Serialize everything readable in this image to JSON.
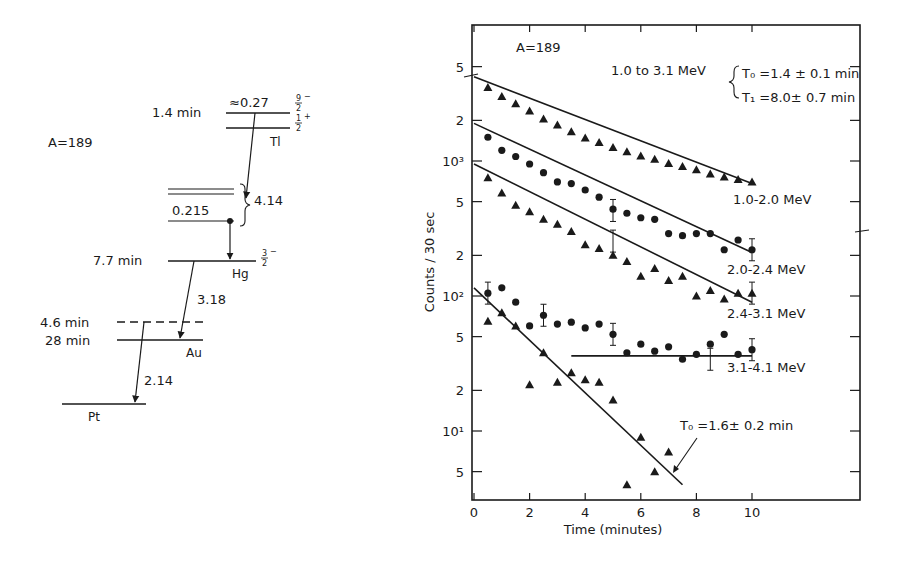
{
  "decay_scheme": {
    "mass_label": "A=189",
    "levels": [
      {
        "nuclide": "Tl",
        "halflife": "1.4 min",
        "energy": "≈0.27",
        "spin_upper": "9/2",
        "parity_upper": "-",
        "spin_lower": "1/2",
        "parity_lower": "+"
      },
      {
        "nuclide": "Hg",
        "halflife": "7.7 min",
        "energy_sub": "0.215",
        "spin": "3/2",
        "parity": "-"
      },
      {
        "nuclide": "Au",
        "halflife_upper": "4.6 min",
        "halflife_lower": "28 min"
      },
      {
        "nuclide": "Pt"
      }
    ],
    "transitions": [
      {
        "from": "Tl",
        "to": "Hg",
        "q_value": "4.14"
      },
      {
        "from": "Hg",
        "to": "Au",
        "q_value": "3.18"
      },
      {
        "from": "Au",
        "to": "Pt",
        "q_value": "2.14"
      }
    ]
  },
  "chart_data": {
    "type": "scatter",
    "title": "A=189",
    "xlabel": "Time (minutes)",
    "ylabel": "Counts / 30 sec",
    "yscale": "log",
    "xlim": [
      0,
      14
    ],
    "ylim": [
      3,
      7000
    ],
    "x_ticks": [
      0,
      2,
      4,
      6,
      8,
      10
    ],
    "y_ticks": [
      {
        "value": 5000,
        "label": "5"
      },
      {
        "value": 2000,
        "label": "2"
      },
      {
        "value": 1000,
        "label": "10³"
      },
      {
        "value": 500,
        "label": "5"
      },
      {
        "value": 200,
        "label": "2"
      },
      {
        "value": 100,
        "label": "10²"
      },
      {
        "value": 50,
        "label": "5"
      },
      {
        "value": 20,
        "label": "2"
      },
      {
        "value": 10,
        "label": "10¹"
      },
      {
        "value": 5,
        "label": "5"
      }
    ],
    "annotations": {
      "fit_range": "1.0 to 3.1 MeV",
      "t0": "T₀ =1.4 ± 0.1 min",
      "t1": "T₁ =8.0± 0.7 min",
      "t0_high": "T₀ =1.6± 0.2 min"
    },
    "series": [
      {
        "name": "1.0-2.0 MeV",
        "marker": "triangle",
        "x": [
          0.5,
          1,
          1.5,
          2,
          2.5,
          3,
          3.5,
          4,
          4.5,
          5,
          5.5,
          6,
          6.5,
          7,
          7.5,
          8,
          8.5,
          9,
          9.5,
          10
        ],
        "y": [
          3500,
          3000,
          2650,
          2350,
          2050,
          1850,
          1650,
          1480,
          1370,
          1260,
          1170,
          1090,
          1030,
          960,
          910,
          860,
          800,
          760,
          730,
          700
        ],
        "fit": [
          [
            0,
            4200
          ],
          [
            10,
            680
          ]
        ]
      },
      {
        "name": "2.0-2.4 MeV",
        "marker": "circle",
        "x": [
          0.5,
          1,
          1.5,
          2,
          2.5,
          3,
          3.5,
          4,
          4.5,
          5,
          5.5,
          6,
          6.5,
          7,
          7.5,
          8,
          8.5,
          9,
          9.5,
          10
        ],
        "y": [
          1500,
          1200,
          1080,
          950,
          820,
          700,
          680,
          610,
          540,
          440,
          410,
          380,
          370,
          290,
          280,
          290,
          290,
          220,
          260,
          220
        ],
        "fit": [
          [
            0,
            1900
          ],
          [
            10,
            210
          ]
        ]
      },
      {
        "name": "2.4-3.1 MeV",
        "marker": "triangle",
        "x": [
          0.5,
          1,
          1.5,
          2,
          2.5,
          3,
          3.5,
          4,
          4.5,
          5,
          5.5,
          6,
          6.5,
          7,
          7.5,
          8,
          8.5,
          9,
          9.5,
          10
        ],
        "y": [
          750,
          580,
          470,
          420,
          370,
          340,
          300,
          240,
          225,
          200,
          180,
          140,
          160,
          130,
          140,
          100,
          110,
          95,
          105,
          105
        ],
        "fit": [
          [
            0,
            950
          ],
          [
            10,
            90
          ]
        ]
      },
      {
        "name": "3.1-4.1 MeV",
        "marker": "circle",
        "x": [
          0.5,
          1,
          1.5,
          2,
          2.5,
          3,
          3.5,
          4,
          4.5,
          5,
          5.5,
          6,
          6.5,
          7,
          7.5,
          8,
          8.5,
          9,
          9.5,
          10
        ],
        "y": [
          105,
          115,
          90,
          60,
          72,
          62,
          64,
          58,
          62,
          52,
          38,
          44,
          39,
          42,
          34,
          37,
          44,
          52,
          37,
          40
        ],
        "fit": [
          [
            3.5,
            36
          ],
          [
            10,
            36
          ]
        ]
      },
      {
        "name": "T0=1.6±0.2 min",
        "marker": "triangle",
        "x": [
          0.5,
          1,
          1.5,
          2,
          2.5,
          3,
          3.5,
          4,
          4.5,
          5,
          5.5,
          6,
          6.5,
          7
        ],
        "y": [
          65,
          75,
          60,
          22,
          38,
          23,
          27,
          24,
          23,
          17,
          4,
          9,
          5,
          7
        ],
        "fit": [
          [
            0,
            115
          ],
          [
            7.5,
            4
          ]
        ]
      }
    ]
  }
}
